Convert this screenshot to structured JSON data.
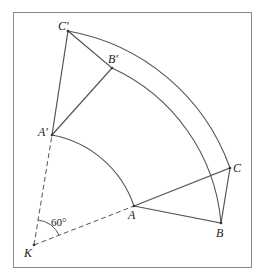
{
  "diagram": {
    "title": "",
    "frame_color": "#8a8a8a",
    "line_color": "#555555",
    "rotation_center": "K",
    "rotation_angle": "60°",
    "points": [
      {
        "id": "C'",
        "label": "C′"
      },
      {
        "id": "B'",
        "label": "B′"
      },
      {
        "id": "A'",
        "label": "A′"
      },
      {
        "id": "K",
        "label": "K"
      },
      {
        "id": "A",
        "label": "A"
      },
      {
        "id": "B",
        "label": "B"
      },
      {
        "id": "C",
        "label": "C"
      }
    ],
    "angle_label": "60°"
  }
}
